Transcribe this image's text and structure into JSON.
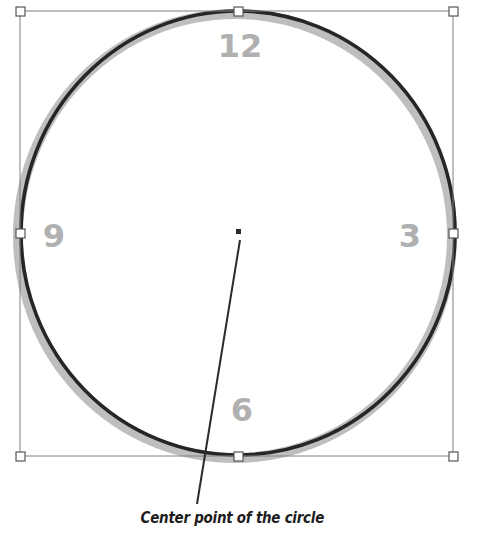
{
  "scene": {
    "title": "Circle selected on canvas",
    "background_color": "#ffffff"
  },
  "shape": {
    "name": "circle",
    "stroke_color": "#262626",
    "glow_color": "#b3b3b3",
    "fill": "none",
    "stroke_width_px": 4,
    "glow_width_px": 10,
    "center": {
      "x": 238,
      "y": 233
    },
    "radius_x": 217,
    "radius_y": 222
  },
  "selection": {
    "box_color": "#808080",
    "handle_fill": "#ffffff",
    "handle_stroke": "#555555",
    "handle_size_px": 9,
    "bounds": {
      "left": 20,
      "top": 11,
      "right": 453,
      "bottom": 456
    },
    "handles": [
      {
        "name": "handle-top-left",
        "x": 20,
        "y": 11
      },
      {
        "name": "handle-top-center",
        "x": 238,
        "y": 11
      },
      {
        "name": "handle-top-right",
        "x": 453,
        "y": 11
      },
      {
        "name": "handle-middle-left",
        "x": 20,
        "y": 233
      },
      {
        "name": "handle-middle-right",
        "x": 453,
        "y": 233
      },
      {
        "name": "handle-bottom-left",
        "x": 20,
        "y": 456
      },
      {
        "name": "handle-bottom-center",
        "x": 238,
        "y": 456
      },
      {
        "name": "handle-bottom-right",
        "x": 453,
        "y": 456
      }
    ]
  },
  "clock_numerals": {
    "color": "#b0b0b0",
    "font_size_px": 32,
    "items": [
      {
        "label": "12",
        "x": 240,
        "y": 57
      },
      {
        "label": "3",
        "x": 410,
        "y": 236
      },
      {
        "label": "6",
        "x": 242,
        "y": 410
      },
      {
        "label": "9",
        "x": 54,
        "y": 236
      }
    ]
  },
  "center_point": {
    "label": "center-point-marker",
    "color": "#2b2b2b",
    "x": 238,
    "y": 231,
    "size_px": 5
  },
  "leader_line": {
    "color": "#2b2b2b",
    "width_px": 2,
    "from": {
      "x": 240,
      "y": 240
    },
    "to": {
      "x": 197,
      "y": 504
    }
  },
  "callout": {
    "text": "Center point of the circle",
    "color": "#1d1d1d"
  }
}
